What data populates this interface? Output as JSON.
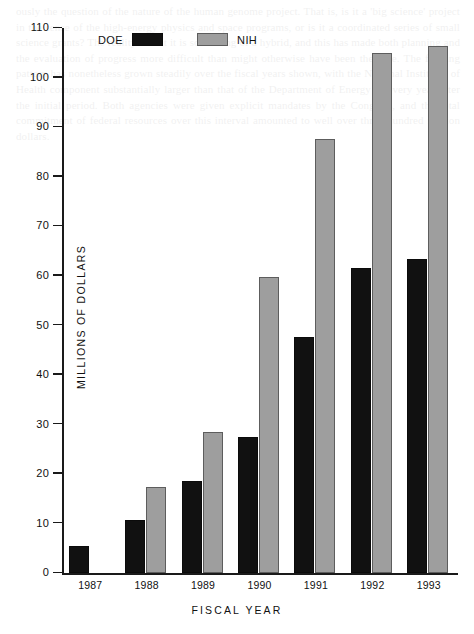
{
  "figure": {
    "ylabel": "MILLIONS OF DOLLARS",
    "xlabel": "FISCAL YEAR"
  },
  "legend": {
    "items": [
      {
        "label": "DOE",
        "color": "#111111",
        "swatch": "doe"
      },
      {
        "label": "NIH",
        "color": "#9e9e9e",
        "swatch": "nih"
      }
    ]
  },
  "yaxis": {
    "ticks": [
      "0",
      "10",
      "20",
      "30",
      "40",
      "50",
      "60",
      "70",
      "80",
      "90",
      "100",
      "110"
    ]
  },
  "ghost_text": "ously the question of the nature of the human genome project. That is, is it a 'big science' project in the sense of the high-energy physics and space programs, or is it a coordinated series of small science grants? The reality is that it is something of a hybrid, and this has made both planning and the evaluation of progress more difficult than might otherwise have been the case. The funding pattern has nonetheless grown steadily over the fiscal years shown, with the National Institutes of Health component substantially larger than that of the Department of Energy in every year after the initial period. Both agencies were given explicit mandates by the Congress, and the total commitment of federal resources over this interval amounted to well over three hundred million dollars.",
  "chart_data": {
    "type": "bar",
    "title": "",
    "xlabel": "FISCAL YEAR",
    "ylabel": "MILLIONS OF DOLLARS",
    "ylim": [
      0,
      110
    ],
    "ytick_step": 10,
    "grid": false,
    "legend_position": "top-left-inside",
    "categories": [
      "1987",
      "1988",
      "1989",
      "1990",
      "1991",
      "1992",
      "1993"
    ],
    "series": [
      {
        "name": "DOE",
        "color": "#111111",
        "values": [
          5.5,
          10.6,
          18.5,
          27.4,
          47.6,
          61.5,
          63.3
        ]
      },
      {
        "name": "NIH",
        "color": "#9e9e9e",
        "values": [
          0,
          17.3,
          28.4,
          59.7,
          87.7,
          105.0,
          106.3
        ]
      }
    ]
  }
}
